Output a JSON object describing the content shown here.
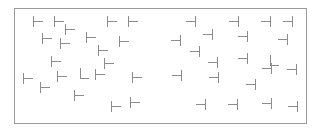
{
  "canvas": {
    "width": 321,
    "height": 132,
    "background_color": "#ffffff"
  },
  "frame": {
    "name": "search-field-frame",
    "x": 14,
    "y": 8,
    "width": 293,
    "height": 116,
    "border_color": "#9a9a9a",
    "border_width": 1,
    "fill_color": "#ffffff"
  },
  "glyph_style": {
    "stroke_color": "#8c8c8c",
    "stroke_width": 1,
    "bar_length": 11,
    "stem_length": 9
  },
  "legend": {
    "t_right_label": "T rotated 90° clockwise (stem points right)",
    "t_left_label": "T rotated 90° counter-clockwise (stem points left)",
    "l_label": "L target"
  },
  "counts": {
    "t_right": 20,
    "t_left": 20,
    "l_shape": 2,
    "total": 42
  },
  "chart_data": {
    "type": "scatter",
    "title": "",
    "xlabel": "",
    "ylabel": "",
    "xlim": [
      14,
      307
    ],
    "ylim": [
      8,
      124
    ],
    "grid": false,
    "legend_position": "none",
    "series": [
      {
        "name": "t-right",
        "glyph": "t-right",
        "points": [
          [
            33,
            16
          ],
          [
            54,
            16
          ],
          [
            107,
            16
          ],
          [
            128,
            16
          ],
          [
            42,
            33
          ],
          [
            60,
            38
          ],
          [
            86,
            32
          ],
          [
            119,
            36
          ],
          [
            98,
            45
          ],
          [
            51,
            56
          ],
          [
            23,
            73
          ],
          [
            57,
            71
          ],
          [
            95,
            69
          ],
          [
            132,
            72
          ],
          [
            40,
            82
          ],
          [
            74,
            90
          ],
          [
            111,
            101
          ],
          [
            130,
            97
          ],
          [
            65,
            24
          ],
          [
            104,
            58
          ]
        ]
      },
      {
        "name": "t-left",
        "glyph": "t-left",
        "points": [
          [
            186,
            16
          ],
          [
            229,
            16
          ],
          [
            261,
            16
          ],
          [
            283,
            16
          ],
          [
            171,
            35
          ],
          [
            203,
            29
          ],
          [
            238,
            31
          ],
          [
            278,
            34
          ],
          [
            208,
            57
          ],
          [
            238,
            53
          ],
          [
            172,
            70
          ],
          [
            209,
            72
          ],
          [
            262,
            63
          ],
          [
            287,
            64
          ],
          [
            196,
            99
          ],
          [
            228,
            99
          ],
          [
            262,
            98
          ],
          [
            288,
            101
          ],
          [
            246,
            79
          ],
          [
            190,
            46
          ]
        ]
      },
      {
        "name": "l-target",
        "glyph": "l-shape",
        "points": [
          [
            80,
            68
          ],
          [
            270,
            55
          ]
        ]
      }
    ]
  }
}
